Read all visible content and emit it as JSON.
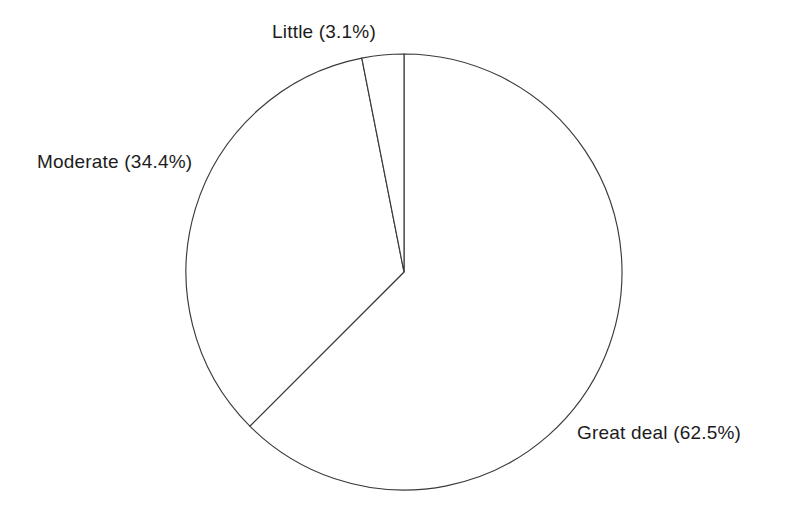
{
  "chart_data": {
    "type": "pie",
    "title": "",
    "subtitle": "",
    "xlabel": "",
    "ylabel": "",
    "grid": false,
    "legend": "none",
    "labels_position": "outside",
    "start_angle_deg": 0,
    "direction": "clockwise",
    "categories": [
      "Great deal",
      "Moderate",
      "Little"
    ],
    "values": [
      62.5,
      34.4,
      3.1
    ],
    "units": "%",
    "slices": [
      {
        "name": "Great deal",
        "value": 62.5,
        "label": "Great deal (62.5%)",
        "start_deg": 0,
        "end_deg": 225.0,
        "color": "#ffffff",
        "stroke": "#3a3a3a"
      },
      {
        "name": "Moderate",
        "value": 34.4,
        "label": "Moderate (34.4%)",
        "start_deg": 225.0,
        "end_deg": 348.84,
        "color": "#ffffff",
        "stroke": "#3a3a3a"
      },
      {
        "name": "Little",
        "value": 3.1,
        "label": "Little (3.1%)",
        "start_deg": 348.84,
        "end_deg": 360.0,
        "color": "#ffffff",
        "stroke": "#3a3a3a"
      }
    ],
    "geometry": {
      "center_x": 404,
      "center_y": 272,
      "radius": 218
    }
  },
  "labels": {
    "little": "Little (3.1%)",
    "moderate": "Moderate (34.4%)",
    "great_deal": "Great deal (62.5%)"
  },
  "colors": {
    "background": "#ffffff",
    "stroke": "#3a3a3a",
    "text": "#1c1c1c"
  }
}
